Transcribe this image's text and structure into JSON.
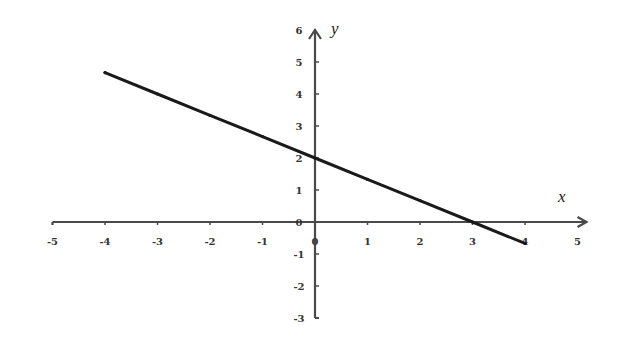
{
  "chart_data": {
    "type": "line",
    "title": "",
    "xlabel": "x",
    "ylabel": "y",
    "xlim": [
      -5,
      5
    ],
    "ylim": [
      -3,
      6
    ],
    "grid": false,
    "legend": null,
    "x_ticks": [
      -5,
      -4,
      -3,
      -2,
      -1,
      0,
      1,
      2,
      3,
      4,
      5
    ],
    "y_ticks": [
      -3,
      -2,
      -1,
      0,
      1,
      2,
      3,
      4,
      5,
      6
    ],
    "series": [
      {
        "name": "y = 2 - (2/3)x",
        "x": [
          -4,
          -3,
          -2,
          -1,
          0,
          1,
          2,
          3,
          4
        ],
        "values": [
          4.67,
          4,
          3.33,
          2.67,
          2,
          1.33,
          0.67,
          0,
          -0.67
        ],
        "color": "#1a1a1a"
      }
    ]
  },
  "colors": {
    "axis": "#4a4a4a",
    "line": "#1a1a1a",
    "background": "#ffffff"
  }
}
